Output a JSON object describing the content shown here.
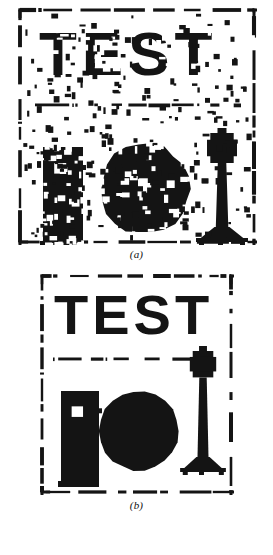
{
  "figure": {
    "kind": "binary-image-noise-removal-figure",
    "background_color": "#ffffff",
    "ink_color": "#111111"
  },
  "panels": [
    {
      "id": "a",
      "caption": "(a)",
      "description": "noisy binary test image",
      "width": 240,
      "height": 238,
      "border": {
        "style": "dashed-broken",
        "color": "#141414",
        "thickness": 3
      },
      "text": {
        "value": "TEST",
        "x": 22,
        "y": 18,
        "font_size": 62,
        "letter_spacing": 5,
        "color": "#141414",
        "degraded": true
      },
      "divider": {
        "y": 98,
        "x1": 18,
        "x2": 224,
        "style": "broken-dashed",
        "thickness": 3
      },
      "shapes": [
        {
          "name": "building-rectangle",
          "type": "rect",
          "x": 26,
          "y": 140,
          "width": 40,
          "height": 100,
          "holes": true
        },
        {
          "name": "disc",
          "type": "circle",
          "cx": 128,
          "cy": 182,
          "r": 45,
          "holes": true
        },
        {
          "name": "lamp-post",
          "type": "lamp",
          "x": 180,
          "y": 124,
          "width": 50,
          "height": 112,
          "holes": false
        }
      ],
      "noise": {
        "present": true,
        "kind": "salt-and-pepper",
        "density": "heavy"
      }
    },
    {
      "id": "b",
      "caption": "(b)",
      "description": "cleaned binary test image",
      "width": 195,
      "height": 222,
      "border": {
        "style": "dashed-broken",
        "color": "#141414",
        "thickness": 3
      },
      "text": {
        "value": "TEST",
        "x": 15,
        "y": 16,
        "font_size": 56,
        "letter_spacing": 4,
        "color": "#141414",
        "degraded": false
      },
      "divider": {
        "y": 86,
        "x1": 14,
        "x2": 172,
        "style": "broken-dashed",
        "thickness": 3
      },
      "shapes": [
        {
          "name": "building-rectangle",
          "type": "rect",
          "x": 22,
          "y": 118,
          "width": 38,
          "height": 96,
          "holes": false
        },
        {
          "name": "disc",
          "type": "circle",
          "cx": 100,
          "cy": 158,
          "r": 40,
          "holes": false
        },
        {
          "name": "lamp-post",
          "type": "lamp",
          "x": 142,
          "y": 76,
          "width": 44,
          "height": 124,
          "holes": false
        }
      ],
      "noise": {
        "present": false,
        "kind": "none",
        "density": "none"
      }
    }
  ]
}
